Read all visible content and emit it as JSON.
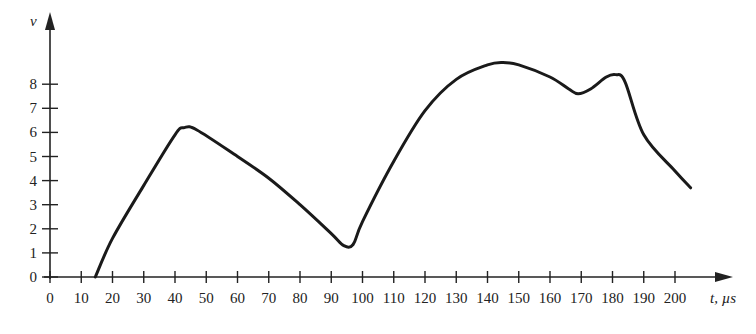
{
  "chart_data": {
    "type": "line",
    "title": "",
    "xlabel": "t, µs",
    "ylabel": "v",
    "xlim": [
      0,
      210
    ],
    "ylim": [
      0,
      9.5
    ],
    "grid": false,
    "legend": null,
    "x_ticks": [
      0,
      10,
      20,
      30,
      40,
      50,
      60,
      70,
      80,
      90,
      100,
      110,
      120,
      130,
      140,
      150,
      160,
      170,
      180,
      190,
      200
    ],
    "y_ticks": [
      0,
      1,
      2,
      3,
      4,
      5,
      6,
      7,
      8
    ],
    "series": [
      {
        "name": "v(t)",
        "x": [
          14.5,
          20,
          30,
          40,
          43,
          47,
          60,
          70,
          80,
          90,
          94,
          97,
          100,
          110,
          120,
          130,
          140,
          145,
          150,
          160,
          166,
          169,
          173,
          178,
          181,
          184,
          190,
          200,
          205
        ],
        "y": [
          0,
          1.6,
          3.8,
          5.9,
          6.2,
          6.1,
          5.0,
          4.1,
          3.0,
          1.8,
          1.3,
          1.35,
          2.3,
          4.8,
          6.9,
          8.2,
          8.8,
          8.9,
          8.8,
          8.3,
          7.8,
          7.6,
          7.8,
          8.3,
          8.4,
          8.1,
          5.9,
          4.4,
          3.7
        ]
      }
    ],
    "annotations": []
  },
  "labels": {
    "y_axis_title": "v",
    "x_axis_title": "t, µs"
  }
}
